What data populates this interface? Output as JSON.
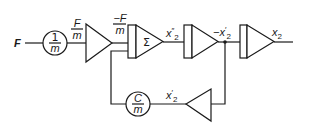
{
  "diagram": {
    "title": "",
    "input": {
      "label": "F"
    },
    "gain_1": {
      "numerator": "1",
      "denominator": "m"
    },
    "signal_F_over_m": {
      "numerator": "F",
      "denominator": "m"
    },
    "inverter_1": {
      "type": "inverter"
    },
    "signal_neg_F_over_m": {
      "numerator": "−F",
      "denominator": "m"
    },
    "summer": {
      "symbol": "Σ"
    },
    "signal_x2_dd": {
      "base": "x",
      "primes": "″",
      "sub": "2"
    },
    "integrator_1": {
      "type": "integrator"
    },
    "signal_neg_x2_d": {
      "prefix": "−",
      "base": "x",
      "primes": "′",
      "sub": "2"
    },
    "integrator_2": {
      "type": "integrator"
    },
    "output": {
      "base": "x",
      "sub": "2"
    },
    "feedback_inverter": {
      "type": "inverter"
    },
    "signal_x2_d": {
      "base": "x",
      "primes": "′",
      "sub": "2"
    },
    "gain_2": {
      "numerator": "C",
      "denominator": "m"
    },
    "colors": {
      "stroke": "#1a1a1a",
      "background": "#ffffff"
    }
  }
}
